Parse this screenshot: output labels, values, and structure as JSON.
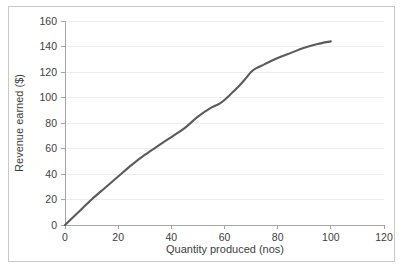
{
  "figure": {
    "background_color": "#ffffff",
    "border_color": "#c9c9c9",
    "plot_background_color": "#ffffff"
  },
  "chart_data": {
    "type": "line",
    "title": "",
    "subtitle": "",
    "xlabel": "Quantity produced (nos)",
    "ylabel": "Revenue earned ($)",
    "xlim": [
      0,
      120
    ],
    "ylim": [
      0,
      160
    ],
    "xticks": [
      0,
      20,
      40,
      60,
      80,
      100,
      120
    ],
    "yticks": [
      0,
      20,
      40,
      60,
      80,
      100,
      120,
      140,
      160
    ],
    "xtick_labels": [
      "0",
      "20",
      "40",
      "60",
      "80",
      "100",
      "120"
    ],
    "ytick_labels": [
      "0",
      "20",
      "40",
      "60",
      "80",
      "100",
      "120",
      "140",
      "160"
    ],
    "grid": "horizontal",
    "grid_color": "#eceded",
    "legend": false,
    "legend_position": "none",
    "line_color": "#5b5b5b",
    "line_width": 2.1,
    "markers": false,
    "series": [
      {
        "name": "Revenue earned",
        "x": [
          0,
          5,
          10,
          15,
          20,
          25,
          30,
          35,
          40,
          45,
          50,
          55,
          58,
          60,
          62,
          65,
          68,
          70,
          72,
          75,
          80,
          85,
          90,
          95,
          100
        ],
        "values": [
          0,
          10,
          20,
          29,
          38,
          47,
          55,
          62,
          69,
          76,
          85,
          92,
          95,
          98,
          102,
          108,
          115,
          120,
          123,
          126,
          131,
          135,
          139,
          142,
          144
        ]
      }
    ]
  }
}
